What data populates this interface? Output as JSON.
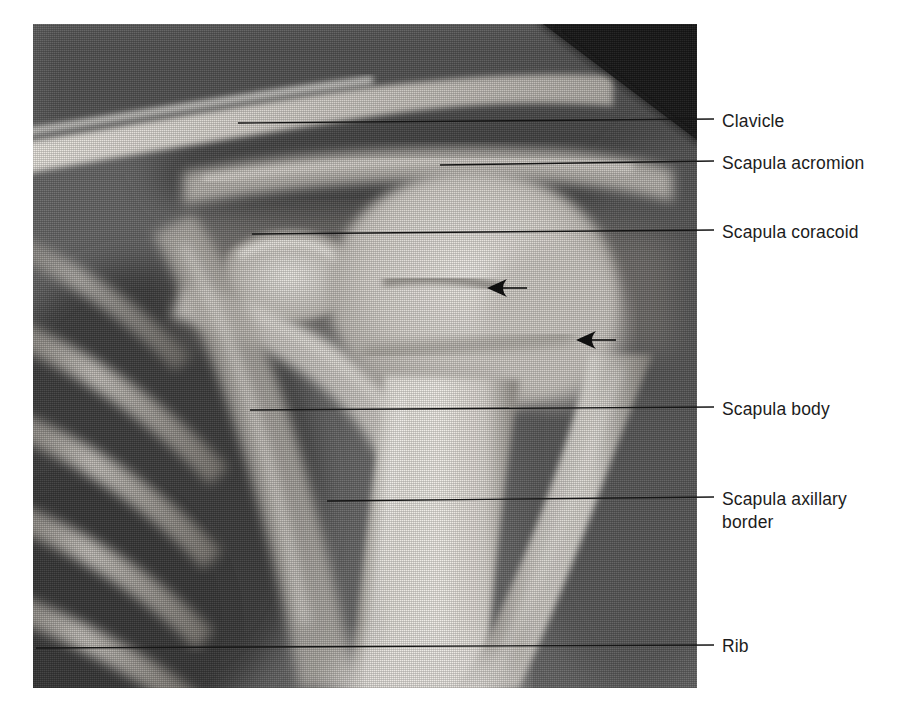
{
  "figure": {
    "type": "annotated-radiograph",
    "modality": "x-ray",
    "view": "shoulder-anteroposterior",
    "background_color": "#ffffff",
    "label_color": "#1c1c1c",
    "leader_color": "#151515",
    "arrow_color": "#101010"
  },
  "labels": [
    {
      "id": "clavicle",
      "text": "Clavicle",
      "x": 722,
      "y": 110
    },
    {
      "id": "scapula-acromion",
      "text": "Scapula acromion",
      "x": 722,
      "y": 152
    },
    {
      "id": "scapula-coracoid",
      "text": "Scapula coracoid",
      "x": 722,
      "y": 221
    },
    {
      "id": "scapula-body",
      "text": "Scapula body",
      "x": 722,
      "y": 398
    },
    {
      "id": "scapula-axillary-border",
      "text": "Scapula axillary\nborder",
      "x": 722,
      "y": 488
    },
    {
      "id": "rib",
      "text": "Rib",
      "x": 722,
      "y": 635
    }
  ],
  "leader_lines": [
    {
      "id": "leader-clavicle",
      "x1": 238,
      "y1": 123,
      "x2": 714,
      "y2": 119
    },
    {
      "id": "leader-scapula-acromion",
      "x1": 440,
      "y1": 165,
      "x2": 714,
      "y2": 161
    },
    {
      "id": "leader-scapula-coracoid",
      "x1": 252,
      "y1": 234,
      "x2": 714,
      "y2": 230
    },
    {
      "id": "leader-scapula-body",
      "x1": 250,
      "y1": 410,
      "x2": 714,
      "y2": 407
    },
    {
      "id": "leader-scapula-axillary-border",
      "x1": 327,
      "y1": 501,
      "x2": 714,
      "y2": 497
    },
    {
      "id": "leader-rib",
      "x1": 36,
      "y1": 648,
      "x2": 714,
      "y2": 645
    }
  ],
  "arrow_markers": [
    {
      "id": "arrow-marker-upper",
      "tip_x": 487,
      "tip_y": 288,
      "tail_x": 527,
      "tail_y": 288,
      "direction": "left"
    },
    {
      "id": "arrow-marker-lower",
      "tip_x": 576,
      "tip_y": 340,
      "tail_x": 616,
      "tail_y": 340,
      "direction": "left"
    }
  ],
  "radiograph": {
    "plate": {
      "x": 33,
      "y": 24,
      "width": 664,
      "height": 664
    },
    "collimation_corner": {
      "id": "dark-corner-wedge",
      "position": "top-right",
      "points": "510,0 664,0 664,116",
      "color": "#1a1a1a"
    },
    "soft_tissue_background": "#6b6b6b",
    "bone_bright": "#e8e6e2",
    "bone_mid": "#c8c5c0",
    "lung_dark": "#3d3d3d"
  }
}
